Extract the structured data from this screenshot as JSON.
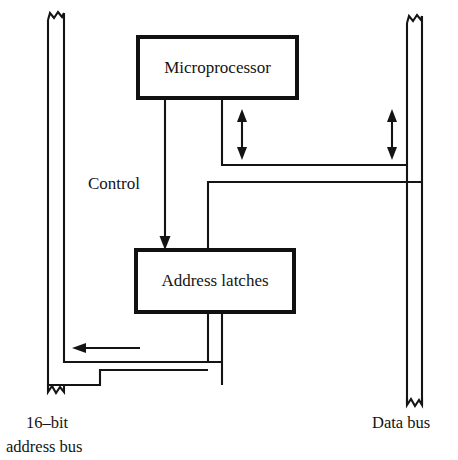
{
  "diagram": {
    "type": "block-diagram",
    "background_color": "#ffffff",
    "line_color": "#141414",
    "box_border_color": "#111111"
  },
  "blocks": [
    {
      "id": "microprocessor",
      "label": "Microprocessor",
      "x": 138,
      "y": 37,
      "width": 159,
      "height": 61
    },
    {
      "id": "address_latches",
      "label": "Address latches",
      "x": 136,
      "y": 250,
      "width": 158,
      "height": 62
    }
  ],
  "labels": {
    "control": "Control",
    "address_bus_line1": "16–bit",
    "address_bus_line2": "address bus",
    "data_bus": "Data bus"
  },
  "buses": [
    {
      "id": "address-bus",
      "name": "16-bit address bus",
      "orientation": "vertical-left",
      "inner_x": 64,
      "outer_x": 48,
      "top_y": 13,
      "bottom_y": 396,
      "torn_top": true,
      "torn_bottom": true
    },
    {
      "id": "data-bus",
      "name": "Data bus",
      "orientation": "vertical-right",
      "inner_x": 407,
      "outer_x": 422,
      "top_y": 16,
      "bottom_y": 405,
      "torn_top": true,
      "torn_bottom": true
    }
  ],
  "connections": [
    {
      "id": "control-line",
      "from": "microprocessor",
      "to": "address_latches",
      "direction": "down",
      "arrowheads": 1,
      "label": "Control"
    },
    {
      "id": "latch-to-address-bus-inner",
      "from": "address_latches",
      "to": "address-bus",
      "direction": "left",
      "arrowheads": 1
    },
    {
      "id": "latch-to-address-bus-outer",
      "from": "address_latches",
      "to": "address-bus",
      "direction": "left",
      "arrowheads": 0
    },
    {
      "id": "cpu-to-data-bus",
      "from": "microprocessor",
      "to": "data-bus",
      "direction": "bidirectional",
      "arrowheads": 2
    },
    {
      "id": "cpu-to-latches-data",
      "from": "microprocessor",
      "to": "address_latches",
      "direction": "down",
      "arrowheads": 0
    }
  ],
  "arrows": [
    {
      "id": "cpu-data-arrow",
      "x": 242,
      "y1": 112,
      "y2": 157,
      "type": "double-headed-vertical"
    },
    {
      "id": "bus-data-arrow",
      "x": 392,
      "y1": 112,
      "y2": 157,
      "type": "double-headed-vertical"
    },
    {
      "id": "control-arrow",
      "x": 165,
      "y1": 100,
      "y2": 247,
      "type": "single-headed-down"
    },
    {
      "id": "address-out-arrow",
      "y": 348,
      "x1": 140,
      "x2": 72,
      "type": "single-headed-left"
    }
  ]
}
